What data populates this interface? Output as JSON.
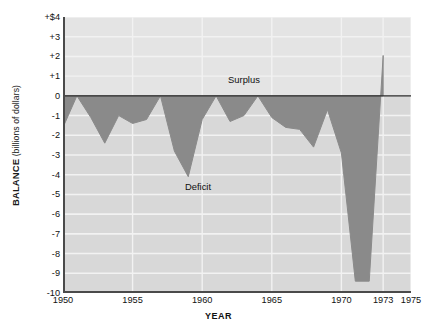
{
  "chart_data": {
    "type": "area",
    "title": "",
    "subtitle": "",
    "xlabel": "YEAR",
    "ylabel": "BALANCE (billions of dollars)",
    "ylabel_strong": "BALANCE",
    "ylabel_light": " (billions of dollars)",
    "xlim": [
      1950,
      1975
    ],
    "ylim": [
      -10,
      4
    ],
    "grid": true,
    "legend_position": "none",
    "baseline": 0,
    "x_ticks": [
      1950,
      1955,
      1960,
      1965,
      1970,
      1973,
      1975
    ],
    "x_tick_labels": [
      "1950",
      "1955",
      "1960",
      "1965",
      "1970",
      "1973",
      "1975"
    ],
    "y_ticks": [
      4,
      3,
      2,
      1,
      0,
      -1,
      -2,
      -3,
      -4,
      -5,
      -6,
      -7,
      -8,
      -9,
      -10
    ],
    "y_tick_labels": [
      "+$4",
      "+3",
      "+2",
      "+1",
      "0",
      "-1",
      "-2",
      "-3",
      "-4",
      "-5",
      "-6",
      "-7",
      "-8",
      "-9",
      "-10"
    ],
    "annotations": [
      {
        "text": "Surplus",
        "x": 1963.0,
        "y": 0.85
      },
      {
        "text": "Deficit",
        "x": 1959.7,
        "y": -4.55
      }
    ],
    "series": [
      {
        "name": "Federal budget balance",
        "x": [
          1950,
          1951,
          1952,
          1953,
          1954,
          1955,
          1956,
          1957,
          1958,
          1959,
          1960,
          1961,
          1962,
          1963,
          1964,
          1965,
          1966,
          1967,
          1968,
          1969,
          1970,
          1971,
          1972,
          1973
        ],
        "values": [
          -1.6,
          0.0,
          -1.1,
          -2.4,
          -1.0,
          -1.4,
          -1.2,
          0.0,
          -2.8,
          -4.1,
          -1.2,
          0.0,
          -1.3,
          -1.0,
          0.0,
          -1.1,
          -1.6,
          -1.7,
          -2.6,
          -0.7,
          -2.9,
          -9.4,
          -9.4,
          2.05
        ],
        "color": "#8a8a8a",
        "fill": true
      }
    ],
    "data_colors": {
      "area_fill": "#8a8a8a",
      "plot_background_above_zero": "#e4e4e4",
      "plot_background_below_zero": "#d8d8d8",
      "gridline": "#f2f2f2",
      "axis_line": "#4a4a4a",
      "zero_line": "#2b2b2b",
      "page_background": "#ffffff"
    }
  }
}
